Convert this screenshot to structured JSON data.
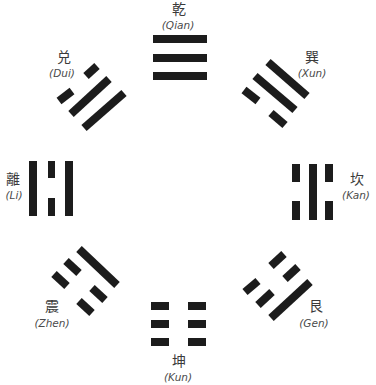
{
  "colors": {
    "line": "#1c1c1c",
    "label": "#3a3a3a",
    "background": "#ffffff"
  },
  "trigrams": [
    {
      "key": "qian",
      "hanzi": "乾",
      "pinyin": "(Qian)",
      "position": "top",
      "lines_inner_to_outer": [
        "solid",
        "solid",
        "solid"
      ]
    },
    {
      "key": "xun",
      "hanzi": "巽",
      "pinyin": "(Xun)",
      "position": "top-right",
      "lines_inner_to_outer": [
        "broken",
        "solid",
        "solid"
      ]
    },
    {
      "key": "kan",
      "hanzi": "坎",
      "pinyin": "(Kan)",
      "position": "right",
      "lines_inner_to_outer": [
        "broken",
        "solid",
        "broken"
      ]
    },
    {
      "key": "gen",
      "hanzi": "艮",
      "pinyin": "(Gen)",
      "position": "bottom-right",
      "lines_inner_to_outer": [
        "broken",
        "broken",
        "solid"
      ]
    },
    {
      "key": "kun",
      "hanzi": "坤",
      "pinyin": "(Kun)",
      "position": "bottom",
      "lines_inner_to_outer": [
        "broken",
        "broken",
        "broken"
      ]
    },
    {
      "key": "zhen",
      "hanzi": "震",
      "pinyin": "(Zhen)",
      "position": "bottom-left",
      "lines_inner_to_outer": [
        "solid",
        "broken",
        "broken"
      ]
    },
    {
      "key": "li",
      "hanzi": "離",
      "pinyin": "(Li)",
      "position": "left",
      "lines_inner_to_outer": [
        "solid",
        "broken",
        "solid"
      ]
    },
    {
      "key": "dui",
      "hanzi": "兑",
      "pinyin": "(Dui)",
      "position": "top-left",
      "lines_inner_to_outer": [
        "solid",
        "solid",
        "broken"
      ]
    }
  ]
}
